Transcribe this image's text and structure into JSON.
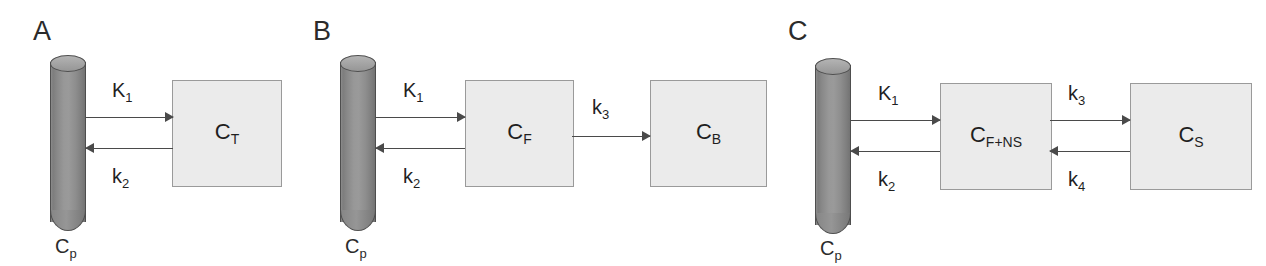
{
  "figure": {
    "kind": "compartmental-model-diagram",
    "panel_count": 3,
    "colors": {
      "box_fill": "#ebebeb",
      "box_border": "#9a9a9a",
      "cylinder_fill": "#8d8d8d",
      "cylinder_border": "#4e4e4e",
      "arrow": "#4a4a4a",
      "text": "#1f1f1f",
      "background": "#ffffff"
    }
  },
  "panels": [
    {
      "letter": "A",
      "plasma": {
        "label_main": "C",
        "label_sub": "p"
      },
      "compartments": [
        {
          "label_main": "C",
          "label_sub": "T"
        }
      ],
      "rates": [
        {
          "main": "K",
          "sub": "1",
          "direction": "right"
        },
        {
          "main": "k",
          "sub": "2",
          "direction": "left"
        }
      ]
    },
    {
      "letter": "B",
      "plasma": {
        "label_main": "C",
        "label_sub": "p"
      },
      "compartments": [
        {
          "label_main": "C",
          "label_sub": "F"
        },
        {
          "label_main": "C",
          "label_sub": "B"
        }
      ],
      "rates": [
        {
          "main": "K",
          "sub": "1",
          "direction": "right"
        },
        {
          "main": "k",
          "sub": "2",
          "direction": "left"
        },
        {
          "main": "k",
          "sub": "3",
          "direction": "right"
        }
      ]
    },
    {
      "letter": "C",
      "plasma": {
        "label_main": "C",
        "label_sub": "p"
      },
      "compartments": [
        {
          "label_main": "C",
          "label_sub": "F+NS"
        },
        {
          "label_main": "C",
          "label_sub": "S"
        }
      ],
      "rates": [
        {
          "main": "K",
          "sub": "1",
          "direction": "right"
        },
        {
          "main": "k",
          "sub": "2",
          "direction": "left"
        },
        {
          "main": "k",
          "sub": "3",
          "direction": "right"
        },
        {
          "main": "k",
          "sub": "4",
          "direction": "left"
        }
      ]
    }
  ]
}
